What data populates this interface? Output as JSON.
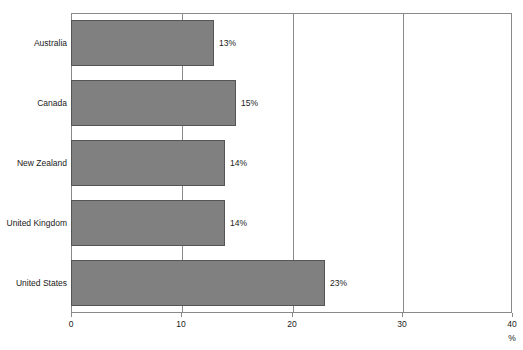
{
  "chart_data": {
    "type": "bar",
    "orientation": "horizontal",
    "title": "",
    "xlabel": "%",
    "ylabel": "",
    "categories": [
      "Australia",
      "Canada",
      "New Zealand",
      "United Kingdom",
      "United States"
    ],
    "values": [
      13,
      15,
      14,
      14,
      23
    ],
    "value_labels": [
      "13%",
      "15%",
      "14%",
      "14%",
      "23%"
    ],
    "xlim": [
      0,
      40
    ],
    "xticks": [
      0,
      10,
      20,
      30,
      40
    ],
    "xtick_labels": [
      "0",
      "10",
      "20",
      "30",
      "40"
    ],
    "grid": true,
    "grid_axis": "x",
    "legend": null,
    "series": [
      {
        "name": "",
        "values": [
          13,
          15,
          14,
          14,
          23
        ],
        "color": "#808080"
      }
    ]
  },
  "colors": {
    "bar_fill": "#808080",
    "bar_border": "#555555",
    "axis": "#8a8a8a",
    "text": "#1a1a1a",
    "background": "#ffffff"
  },
  "title_clip": {
    "text": ""
  }
}
